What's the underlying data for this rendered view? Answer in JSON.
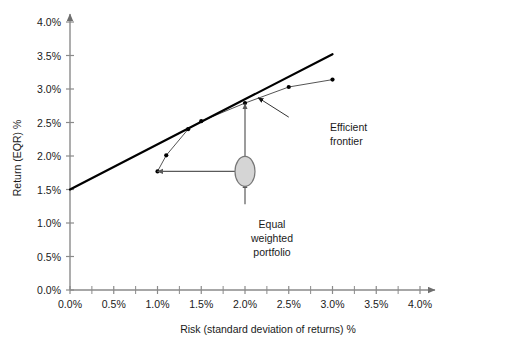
{
  "chart_data": {
    "type": "line",
    "title": "",
    "xlabel": "Risk (standard deviation of returns) %",
    "ylabel": "Return (EQR) %",
    "xlim": [
      0.0,
      4.0
    ],
    "ylim": [
      0.0,
      4.0
    ],
    "grid": false,
    "legend": "none",
    "x_ticks": [
      "0.0%",
      "0.5%",
      "1.0%",
      "1.5%",
      "2.0%",
      "2.5%",
      "3.0%",
      "3.5%",
      "4.0%"
    ],
    "x_tick_values": [
      0.0,
      0.5,
      1.0,
      1.5,
      2.0,
      2.5,
      3.0,
      3.5,
      4.0
    ],
    "x_minor_tick_values": [
      0.25,
      0.75,
      1.25,
      1.75,
      2.25,
      2.75,
      3.25,
      3.75
    ],
    "y_ticks": [
      "0.0%",
      "0.5%",
      "1.0%",
      "1.5%",
      "2.0%",
      "2.5%",
      "3.0%",
      "3.5%",
      "4.0%"
    ],
    "y_tick_values": [
      0.0,
      0.5,
      1.0,
      1.5,
      2.0,
      2.5,
      3.0,
      3.5,
      4.0
    ],
    "series": [
      {
        "name": "Efficient frontier",
        "style": "line-with-markers",
        "color": "#555555",
        "x": [
          1.0,
          1.1,
          1.35,
          1.5,
          2.0,
          2.5,
          3.0
        ],
        "y": [
          1.77,
          2.01,
          2.4,
          2.52,
          2.79,
          3.03,
          3.14
        ]
      },
      {
        "name": "Capital allocation line (tangent)",
        "style": "line",
        "color": "#000000",
        "x": [
          0.0,
          3.0
        ],
        "y": [
          1.5,
          3.52
        ]
      }
    ],
    "markers": [
      {
        "name": "Equal weighted portfolio",
        "shape": "ellipse",
        "x": 2.0,
        "y": 1.77,
        "fill": "#d5d5d5",
        "stroke": "#777777"
      }
    ],
    "annotations": [
      {
        "name": "efficient-frontier-annotation",
        "text_lines": [
          "Efficient",
          "frontier"
        ],
        "text_x": 2.55,
        "text_y": 2.42,
        "arrow_from_x": 2.5,
        "arrow_from_y": 2.58,
        "arrow_to_x": 2.15,
        "arrow_to_y": 2.87
      },
      {
        "name": "equal-weighted-portfolio-annotation",
        "text_lines": [
          "Equal",
          "weighted",
          "portfolio"
        ],
        "text_x": 2.0,
        "text_y": 1.18
      }
    ],
    "leader_lines": [
      {
        "name": "vertical-up-to-frontier",
        "from_x": 2.0,
        "from_y": 1.95,
        "to_x": 2.0,
        "to_y": 2.78,
        "arrow": "both"
      },
      {
        "name": "vertical-down-to-label",
        "from_x": 2.0,
        "from_y": 1.28,
        "to_x": 2.0,
        "to_y": 1.6,
        "arrow": "end"
      },
      {
        "name": "horizontal-left-to-frontier",
        "from_x": 1.94,
        "from_y": 1.77,
        "to_x": 1.0,
        "to_y": 1.77,
        "arrow": "end"
      }
    ]
  },
  "axes": {
    "x_title": "Risk (standard deviation of returns) %",
    "y_title": "Return (EQR) %"
  },
  "labels": {
    "efficient_frontier_line1": "Efficient",
    "efficient_frontier_line2": "frontier",
    "equal_weighted_line1": "Equal",
    "equal_weighted_line2": "weighted",
    "equal_weighted_line3": "portfolio"
  },
  "tick_text": {
    "x": [
      "0.0%",
      "0.5%",
      "1.0%",
      "1.5%",
      "2.0%",
      "2.5%",
      "3.0%",
      "3.5%",
      "4.0%"
    ],
    "y": [
      "0.0%",
      "0.5%",
      "1.0%",
      "1.5%",
      "2.0%",
      "2.5%",
      "3.0%",
      "3.5%",
      "4.0%"
    ]
  },
  "colors": {
    "axis": "#8a8a8a",
    "tangent_line": "#000000",
    "frontier_line": "#5a5a5a",
    "marker": "#000000",
    "ellipse_fill": "#d5d5d5",
    "ellipse_stroke": "#777777",
    "text": "#1a1a1a"
  }
}
